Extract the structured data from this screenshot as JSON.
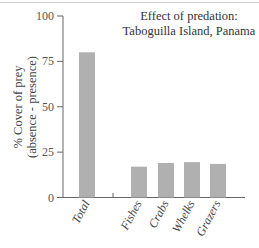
{
  "chart_data": {
    "type": "bar",
    "title": "Effect of predation:",
    "subtitle": "Taboguilla Island, Panama",
    "xlabel": "",
    "ylabel": "% Cover of prey",
    "ylabel_line2": "(absence - presence)",
    "ylim": [
      0,
      100
    ],
    "yticks": [
      0,
      25,
      50,
      75,
      100
    ],
    "categories": [
      "Total",
      "Fishes",
      "Crabs",
      "Whelks",
      "Grazers"
    ],
    "values": [
      80,
      17,
      19,
      19.5,
      18.5
    ],
    "bar_color": "#b0b0b0",
    "grid": false,
    "legend": null
  },
  "labels": {
    "title_line1": "Effect of predation:",
    "title_line2": "Taboguilla Island, Panama",
    "ylabel_line1": "% Cover of prey",
    "ylabel_line2": "(absence - presence)",
    "yticks": [
      "0",
      "25",
      "50",
      "75",
      "100"
    ],
    "categories": [
      "Total",
      "Fishes",
      "Crabs",
      "Whelks",
      "Grazers"
    ]
  }
}
